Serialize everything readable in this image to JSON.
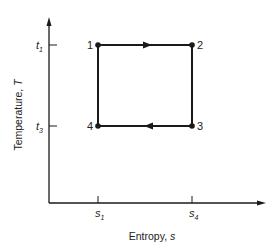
{
  "diagram": {
    "y_axis_label": "Temperature, ",
    "y_axis_symbol": "T",
    "x_axis_label": "Entropy, ",
    "x_axis_symbol": "s",
    "y_ticks": [
      {
        "base": "t",
        "sub": "1"
      },
      {
        "base": "t",
        "sub": "3"
      }
    ],
    "x_ticks": [
      {
        "base": "s",
        "sub": "1"
      },
      {
        "base": "s",
        "sub": "4"
      }
    ],
    "states": [
      {
        "label": "1"
      },
      {
        "label": "2"
      },
      {
        "label": "3"
      },
      {
        "label": "4"
      }
    ],
    "processes": [
      {
        "from": "1",
        "to": "2",
        "arrow": true
      },
      {
        "from": "2",
        "to": "3",
        "arrow": false
      },
      {
        "from": "3",
        "to": "4",
        "arrow": true
      },
      {
        "from": "4",
        "to": "1",
        "arrow": false
      }
    ],
    "line_color": "#1a1a1a"
  }
}
